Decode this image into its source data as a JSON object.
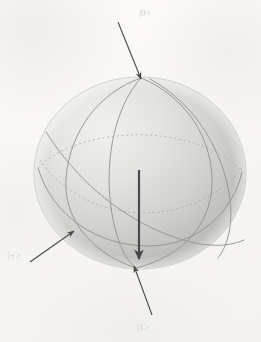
{
  "figure": {
    "kind": "bloch-sphere-diagram",
    "background_color": "#faf9f7",
    "sphere": {
      "center_x": 140,
      "center_y": 173,
      "radius_x": 106,
      "radius_y": 96,
      "fill_light": "#e9e9e7",
      "fill_dark": "#b4b4b2",
      "outline_color": "#b9b9b6",
      "grid_color": "#9a9a98",
      "grid_dashed_color": "#a8a8a6"
    },
    "arrow_color": "#4a4a4a",
    "label_color": "#cfcdc9"
  },
  "labels": {
    "north_pole": "|0>",
    "south_pole": "|1>",
    "front_equator": "|+>"
  },
  "arrows": [
    {
      "name": "arrow-to-zero",
      "from_x": 118,
      "from_y": 22,
      "to_x": 141,
      "to_y": 79,
      "width": 1.1
    },
    {
      "name": "arrow-to-one",
      "from_x": 152,
      "from_y": 315,
      "to_x": 134,
      "to_y": 266,
      "width": 1.1
    },
    {
      "name": "arrow-to-plus",
      "from_x": 30,
      "from_y": 262,
      "to_x": 74,
      "to_y": 231,
      "width": 1.1
    },
    {
      "name": "arrow-state-vector",
      "from_x": 139,
      "from_y": 170,
      "to_x": 139,
      "to_y": 261,
      "width": 2.2
    }
  ],
  "grid_curves": [
    {
      "name": "equator-ellipse",
      "style": "solid"
    },
    {
      "name": "meridian-vertical",
      "style": "solid"
    },
    {
      "name": "meridian-tilted-left",
      "style": "solid"
    },
    {
      "name": "meridian-tilted-right",
      "style": "solid"
    },
    {
      "name": "latitude-hidden",
      "style": "dashed"
    },
    {
      "name": "equator-hidden-arc",
      "style": "dashed"
    }
  ]
}
